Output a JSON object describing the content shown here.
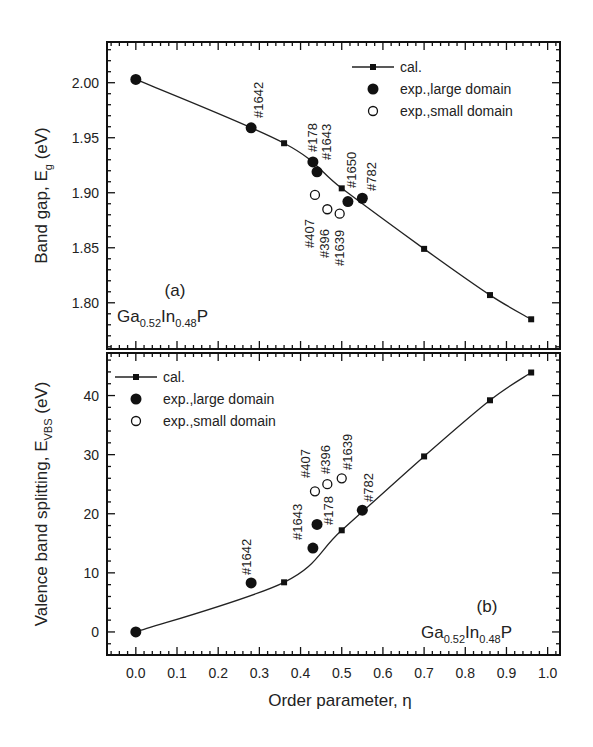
{
  "chart_data": [
    {
      "type": "scatter",
      "panel": "(a)",
      "title": "",
      "xlabel": "Order parameter, η",
      "ylabel": "Band gap, E_g (eV)",
      "ylabel_main": "Band gap, E",
      "ylabel_sub": "g",
      "ylabel_unit": " (eV)",
      "xlim": [
        -0.07,
        1.03
      ],
      "ylim": [
        1.758,
        2.037
      ],
      "yticks": [
        1.8,
        1.85,
        1.9,
        1.95,
        2.0
      ],
      "ytick_labels": [
        "1.80",
        "1.85",
        "1.90",
        "1.95",
        "2.00"
      ],
      "grid": false,
      "legend_position": "upper right",
      "material": {
        "base": "Ga",
        "s1": "0.52",
        "mid": "In",
        "s2": "0.48",
        "end": "P"
      },
      "series": [
        {
          "name": "cal.",
          "marker": "square-line",
          "x": [
            0.0,
            0.36,
            0.5,
            0.7,
            0.86,
            0.96
          ],
          "y": [
            2.003,
            1.945,
            1.904,
            1.849,
            1.807,
            1.785
          ]
        },
        {
          "name": "exp.,large domain",
          "marker": "filled-circle",
          "x": [
            0.0,
            0.28,
            0.43,
            0.44,
            0.515,
            0.55
          ],
          "y": [
            2.003,
            1.959,
            1.928,
            1.919,
            1.892,
            1.895
          ],
          "labels": [
            "",
            "#1642",
            "#178",
            "#1643",
            "#1650",
            "#782"
          ]
        },
        {
          "name": "exp.,small domain",
          "marker": "open-circle",
          "x": [
            0.435,
            0.465,
            0.495
          ],
          "y": [
            1.898,
            1.885,
            1.881
          ],
          "labels": [
            "#407",
            "#396",
            "#1639"
          ]
        }
      ]
    },
    {
      "type": "scatter",
      "panel": "(b)",
      "title": "",
      "xlabel": "Order parameter, η",
      "ylabel": "Valence band splitting, E_VBS (eV)",
      "ylabel_main": "Valence band splitting, E",
      "ylabel_sub": "VBS",
      "ylabel_unit": " (eV)",
      "xlim": [
        -0.07,
        1.03
      ],
      "ylim": [
        -3.9,
        47.2
      ],
      "yticks": [
        0,
        10,
        20,
        30,
        40
      ],
      "ytick_labels": [
        "0",
        "10",
        "20",
        "30",
        "40"
      ],
      "xticks": [
        0.0,
        0.1,
        0.2,
        0.3,
        0.4,
        0.5,
        0.6,
        0.7,
        0.8,
        0.9,
        1.0
      ],
      "xtick_labels": [
        "0.0",
        "0.1",
        "0.2",
        "0.3",
        "0.4",
        "0.5",
        "0.6",
        "0.7",
        "0.8",
        "0.9",
        "1.0"
      ],
      "grid": false,
      "legend_position": "upper left",
      "material": {
        "base": "Ga",
        "s1": "0.52",
        "mid": "In",
        "s2": "0.48",
        "end": "P"
      },
      "series": [
        {
          "name": "cal.",
          "marker": "square-line",
          "x": [
            0.0,
            0.36,
            0.5,
            0.7,
            0.86,
            0.96
          ],
          "y": [
            0.0,
            8.4,
            17.2,
            29.7,
            39.2,
            43.9
          ]
        },
        {
          "name": "exp.,large domain",
          "marker": "filled-circle",
          "x": [
            0.0,
            0.28,
            0.43,
            0.44,
            0.55
          ],
          "y": [
            0.0,
            8.3,
            14.2,
            18.2,
            20.6
          ],
          "labels": [
            "",
            "#1642",
            "#1643",
            "#178",
            "#782"
          ]
        },
        {
          "name": "exp.,small domain",
          "marker": "open-circle",
          "x": [
            0.435,
            0.465,
            0.5
          ],
          "y": [
            23.8,
            25.0,
            26.0
          ],
          "labels": [
            "#407",
            "#396",
            "#1639"
          ]
        }
      ]
    }
  ]
}
